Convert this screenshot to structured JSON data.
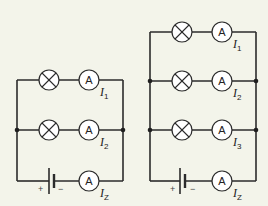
{
  "diagram": {
    "type": "circuit-schematic",
    "colors": {
      "background": "#f3f4ea",
      "line": "#2b2b2b"
    },
    "circuits": [
      {
        "name": "parallel-two-bulbs",
        "branches": [
          {
            "components": [
              "lamp",
              "ammeter"
            ],
            "ammeter_symbol": "A",
            "current_label": "I",
            "current_sub": "1"
          },
          {
            "components": [
              "lamp",
              "ammeter"
            ],
            "ammeter_symbol": "A",
            "current_label": "I",
            "current_sub": "2"
          }
        ],
        "supply": {
          "components": [
            "battery",
            "ammeter"
          ],
          "ammeter_symbol": "A",
          "current_label": "I",
          "current_sub": "Z",
          "plus": "+",
          "minus": "−"
        }
      },
      {
        "name": "parallel-three-bulbs",
        "branches": [
          {
            "components": [
              "lamp",
              "ammeter"
            ],
            "ammeter_symbol": "A",
            "current_label": "I",
            "current_sub": "1"
          },
          {
            "components": [
              "lamp",
              "ammeter"
            ],
            "ammeter_symbol": "A",
            "current_label": "I",
            "current_sub": "2"
          },
          {
            "components": [
              "lamp",
              "ammeter"
            ],
            "ammeter_symbol": "A",
            "current_label": "I",
            "current_sub": "3"
          }
        ],
        "supply": {
          "components": [
            "battery",
            "ammeter"
          ],
          "ammeter_symbol": "A",
          "current_label": "I",
          "current_sub": "Z",
          "plus": "+",
          "minus": "−"
        }
      }
    ]
  }
}
